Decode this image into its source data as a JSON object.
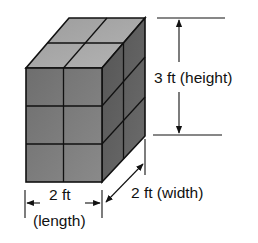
{
  "diagram": {
    "cube_grid": {
      "length_units": 2,
      "width_units": 2,
      "height_units": 3
    },
    "labels": {
      "height": "3 ft (height)",
      "length_value": "2 ft",
      "length_name": "(length)",
      "width": "2 ft (width)"
    },
    "colors": {
      "front_face": "#7c7c7c",
      "top_face": "#a9a9a9",
      "side_face": "#606060",
      "edges": "#111111"
    }
  }
}
